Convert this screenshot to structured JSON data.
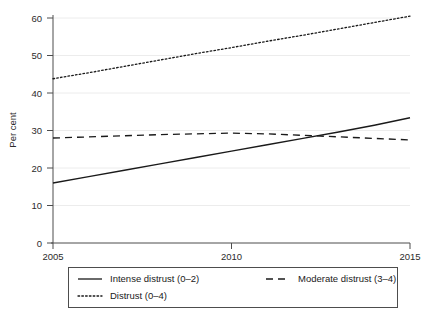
{
  "chart_data": {
    "type": "line",
    "title": "",
    "subtitle": "",
    "xlabel": "",
    "ylabel": "Per cent",
    "xlim": [
      2005,
      2015
    ],
    "ylim": [
      0,
      60
    ],
    "grid": "horizontal",
    "legend_position": "bottom",
    "x": [
      2005,
      2006,
      2007,
      2008,
      2009,
      2010,
      2011,
      2012,
      2013,
      2014,
      2015
    ],
    "xticks": [
      2005,
      2010,
      2015
    ],
    "xtick_labels": [
      "2005",
      "2010",
      "2015"
    ],
    "yticks": [
      0,
      10,
      20,
      30,
      40,
      50,
      60
    ],
    "ytick_labels": [
      "0",
      "10",
      "20",
      "30",
      "40",
      "50",
      "60"
    ],
    "series": [
      {
        "name": "Intense distrust (0–2)",
        "style": "solid",
        "color": "#1a1a1a",
        "values": [
          16.0,
          17.7,
          19.4,
          21.1,
          22.8,
          24.5,
          26.2,
          27.9,
          29.6,
          31.4,
          33.4
        ]
      },
      {
        "name": "Moderate distrust (3–4)",
        "style": "dashed",
        "color": "#1a1a1a",
        "values": [
          28.0,
          28.3,
          28.6,
          28.9,
          29.1,
          29.3,
          29.1,
          28.7,
          28.3,
          27.9,
          27.5
        ]
      },
      {
        "name": "Distrust (0–4)",
        "style": "dotted",
        "color": "#1a1a1a",
        "values": [
          43.8,
          45.4,
          47.1,
          48.8,
          50.5,
          52.1,
          53.8,
          55.4,
          57.1,
          58.8,
          60.5
        ]
      }
    ]
  },
  "axis": {
    "ylabel": "Per cent",
    "ytick_labels": [
      "60",
      "50",
      "40",
      "30",
      "20",
      "10",
      "0"
    ],
    "xtick_labels": [
      "2005",
      "2010",
      "2015"
    ]
  },
  "legend": {
    "items": [
      {
        "label": "Intense distrust (0–2)",
        "style": "solid"
      },
      {
        "label": "Moderate distrust (3–4)",
        "style": "dashed"
      },
      {
        "label": "Distrust (0–4)",
        "style": "dotted"
      }
    ]
  },
  "colors": {
    "line": "#1a1a1a",
    "axis": "#4d4d4d",
    "grid": "#e8e8e8",
    "background": "#ffffff"
  }
}
